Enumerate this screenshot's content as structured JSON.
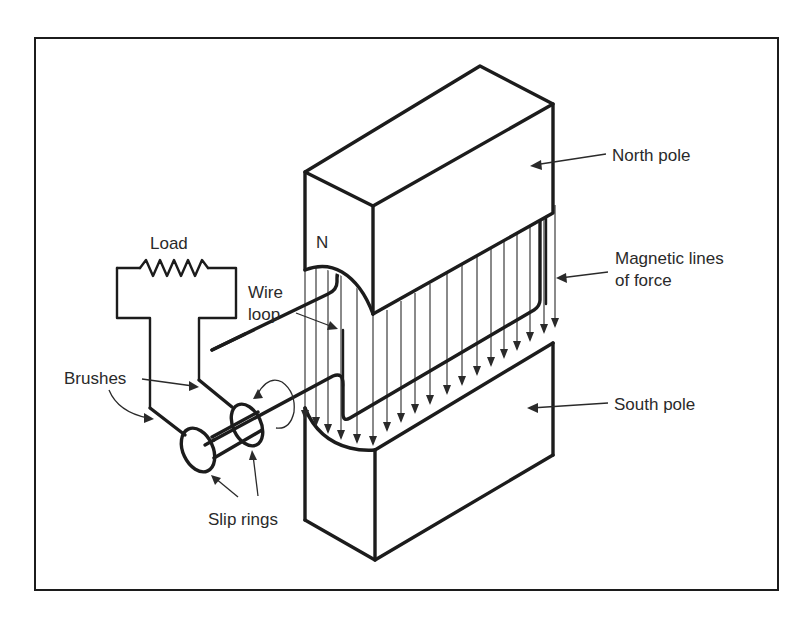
{
  "figure": {
    "frame_color": "#1c1c1c",
    "background": "#ffffff"
  },
  "labels": {
    "north_pole": "North pole",
    "magnetic_lines_1": "Magnetic lines",
    "magnetic_lines_2": "of force",
    "south_pole": "South pole",
    "load": "Load",
    "wire_1": "Wire",
    "wire_2": "loop",
    "brushes": "Brushes",
    "slip_rings": "Slip rings",
    "pole_marker": "N"
  },
  "components": [
    {
      "name": "north-pole-magnet",
      "label": "North pole"
    },
    {
      "name": "south-pole-magnet",
      "label": "South pole"
    },
    {
      "name": "magnetic-field-lines",
      "label": "Magnetic lines of force",
      "direction": "downward (N to S)",
      "count": 18
    },
    {
      "name": "wire-loop",
      "label": "Wire loop"
    },
    {
      "name": "slip-rings",
      "label": "Slip rings",
      "count": 2
    },
    {
      "name": "brushes",
      "label": "Brushes",
      "count": 2
    },
    {
      "name": "load-resistor",
      "label": "Load"
    },
    {
      "name": "rotation-arrow",
      "label": ""
    }
  ]
}
